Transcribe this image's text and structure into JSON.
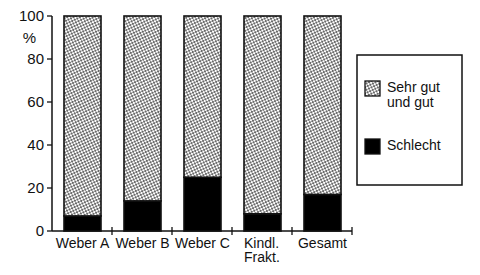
{
  "chart_data": {
    "type": "bar",
    "stacked": true,
    "title": "",
    "xlabel": "",
    "ylabel": "%",
    "ylim": [
      0,
      100
    ],
    "yticks": [
      0,
      20,
      40,
      60,
      80,
      100
    ],
    "grid": false,
    "categories": [
      "Weber A",
      "Weber B",
      "Weber C",
      "Kindl. Frakt.",
      "Gesamt"
    ],
    "category_lines": [
      [
        "Weber A"
      ],
      [
        "Weber B"
      ],
      [
        "Weber C"
      ],
      [
        "Kindl.",
        "Frakt."
      ],
      [
        "Gesamt"
      ]
    ],
    "series": [
      {
        "name": "Schlecht",
        "pattern": "solid",
        "color": "#000000",
        "values": [
          7,
          14,
          25,
          8,
          17
        ]
      },
      {
        "name": "Sehr gut und gut",
        "pattern": "dotted",
        "color": "#ffffff",
        "values": [
          93,
          86,
          75,
          92,
          83
        ]
      }
    ],
    "legend": {
      "placement": "right",
      "entries": [
        {
          "lines": [
            "Sehr gut",
            "und gut"
          ],
          "pattern": "dotted"
        },
        {
          "lines": [
            "Schlecht"
          ],
          "pattern": "solid"
        }
      ]
    }
  }
}
